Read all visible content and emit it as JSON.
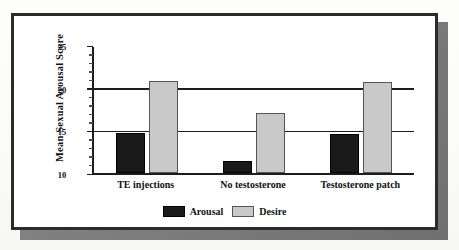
{
  "chart_data": {
    "type": "bar",
    "title": "",
    "xlabel": "",
    "ylabel": "Mean Sexual Arousal Score",
    "categories": [
      "TE injections",
      "No testosterone",
      "Testosterone patch"
    ],
    "series": [
      {
        "name": "Arousal",
        "color": "#1a1a1a",
        "values": [
          14.8,
          11.4,
          14.7
        ]
      },
      {
        "name": "Desire",
        "color": "#c9c9c9",
        "values": [
          21.0,
          17.1,
          20.8
        ]
      }
    ],
    "ylim": [
      10,
      25
    ],
    "ytick_labels": [
      "10",
      "15",
      "20",
      "25"
    ],
    "ytick_values": [
      10,
      15,
      20,
      25
    ],
    "minor_tick_values": [
      11,
      12,
      13,
      14,
      16,
      17,
      18,
      19,
      21,
      22,
      23,
      24
    ],
    "gridlines_at": [
      15,
      20
    ],
    "grid": true,
    "legend_position": "bottom"
  },
  "legend": {
    "items": [
      {
        "label": "Arousal",
        "swatch": "dark-swatch"
      },
      {
        "label": "Desire",
        "swatch": "light-swatch"
      }
    ]
  }
}
